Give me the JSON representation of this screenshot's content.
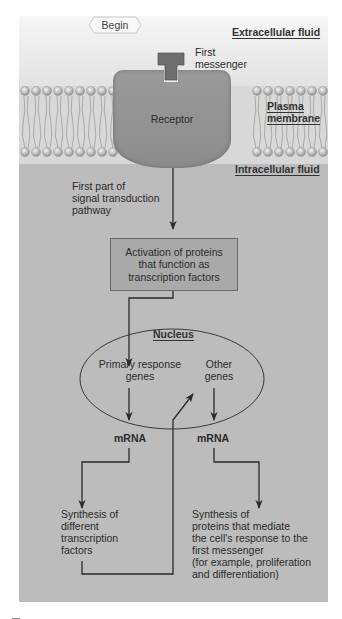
{
  "diagram": {
    "begin_label": "Begin",
    "regions": {
      "extracellular": "Extracellular fluid",
      "membrane_line1": "Plasma",
      "membrane_line2": "membrane",
      "intracellular": "Intracellular fluid"
    },
    "first_messenger": {
      "line1": "First",
      "line2": "messenger"
    },
    "receptor": "Receptor",
    "pathway_label": {
      "line1": "First part of",
      "line2": "signal transduction",
      "line3": "pathway"
    },
    "activation_box": {
      "line1": "Activation of proteins",
      "line2": "that function as",
      "line3": "transcription factors"
    },
    "nucleus": {
      "label": "Nucleus",
      "primary_genes": {
        "line1": "Primary response",
        "line2": "genes"
      },
      "other_genes": {
        "line1": "Other",
        "line2": "genes"
      }
    },
    "mrna_left": "mRNA",
    "mrna_right": "mRNA",
    "synthesis_left": {
      "line1": "Synthesis of",
      "line2": "different",
      "line3": "transcription",
      "line4": "factors"
    },
    "synthesis_right": {
      "line1": "Synthesis of",
      "line2": "proteins that mediate",
      "line3": "the cell's response to the",
      "line4": "first messenger",
      "line5": "(for example, proliferation",
      "line6": "and differentiation)"
    },
    "colors": {
      "panel": "#bdbdbd",
      "extracellular": "#efefef",
      "receptor": "#939393",
      "messenger": "#6e6e6e",
      "box": "#a9a9a9",
      "lines": "#2a2a2a"
    }
  }
}
